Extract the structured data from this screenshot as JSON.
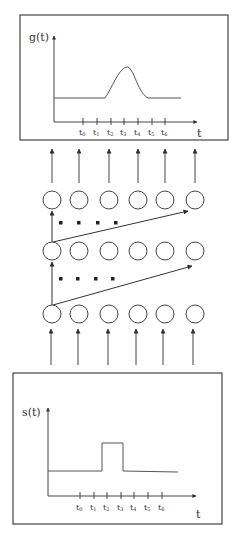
{
  "diagram": {
    "colors": {
      "stroke": "#3a3a3a",
      "text": "#333333",
      "background": "#ffffff"
    },
    "output_plot": {
      "ylabel": "g(t)",
      "xlabel": "t",
      "ticks": [
        "t0",
        "t1",
        "t2",
        "t3",
        "t4",
        "t5",
        "t6"
      ],
      "tick_labels": [
        {
          "base": "t",
          "sub": "0"
        },
        {
          "base": "t",
          "sub": "1"
        },
        {
          "base": "t",
          "sub": "2"
        },
        {
          "base": "t",
          "sub": "3"
        },
        {
          "base": "t",
          "sub": "4"
        },
        {
          "base": "t",
          "sub": "5"
        },
        {
          "base": "t",
          "sub": "6"
        }
      ],
      "shape": "smooth bump peaking near t3"
    },
    "input_plot": {
      "ylabel": "s(t)",
      "xlabel": "t",
      "tick_labels": [
        {
          "base": "t",
          "sub": "0"
        },
        {
          "base": "t",
          "sub": "1"
        },
        {
          "base": "t",
          "sub": "2"
        },
        {
          "base": "t",
          "sub": "3"
        },
        {
          "base": "t",
          "sub": "4"
        },
        {
          "base": "t",
          "sub": "5"
        },
        {
          "base": "t",
          "sub": "6"
        }
      ],
      "shape": "rectangular pulse between t2 and t3"
    },
    "network": {
      "layers": 3,
      "nodes_per_layer": 6,
      "skip_dots": "...."
    }
  }
}
